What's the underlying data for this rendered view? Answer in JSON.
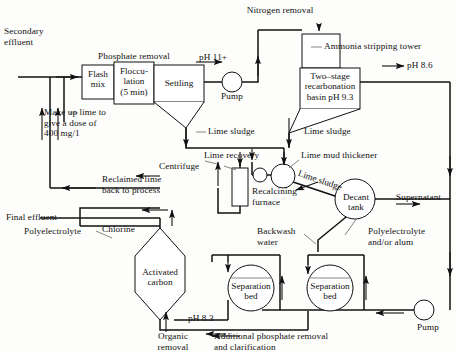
{
  "figure": {
    "type": "process-flow-diagram",
    "stroke_color": "#111111",
    "background_color": "#fdfdfb"
  },
  "section_titles": {
    "phosphate_removal": "Phosphate removal",
    "nitrogen_removal": "Nitrogen removal"
  },
  "units": [
    {
      "id": "flash-mix",
      "label": "Flash\nmix",
      "shape": "rect"
    },
    {
      "id": "flocculation",
      "label": "Floccu-\nlation\n(5 min)",
      "shape": "rect"
    },
    {
      "id": "settling",
      "label": "Settling",
      "shape": "rect-with-hopper"
    },
    {
      "id": "ammonia-stripping-tower",
      "label": "",
      "shape": "tall-rect"
    },
    {
      "id": "recarbonation-basin",
      "label": "Two–stage\nrecarbonation\nbasin pH 9.3",
      "shape": "rect-with-hopper"
    },
    {
      "id": "lime-mud-thickener",
      "label": "",
      "shape": "circle"
    },
    {
      "id": "centrifuge",
      "label": "",
      "shape": "tall-rect"
    },
    {
      "id": "recalcining-furnace",
      "label": "Recalcining\nfurnace",
      "shape": "label-only"
    },
    {
      "id": "decant-tank",
      "label": "Decant\ntank",
      "shape": "circle"
    },
    {
      "id": "activated-carbon",
      "label": "Activated\ncarbon",
      "shape": "hexagon"
    },
    {
      "id": "separation-bed-1",
      "label": "Separation\nbed",
      "shape": "circle"
    },
    {
      "id": "separation-bed-2",
      "label": "Separation\nbed",
      "shape": "circle"
    }
  ],
  "equipment_labels": {
    "ammonia_stripping_tower": "Ammonia stripping tower",
    "lime_mud_thickener": "Lime mud thickener",
    "centrifuge": "Centrifuge",
    "recalcining_furnace": "Recalcining\nfurnace",
    "decant_tank": "Decant\ntank",
    "activated_carbon": "Activated\ncarbon",
    "separation_bed": "Separation\nbed",
    "pump": "Pump"
  },
  "stream_labels": {
    "secondary_effluent": "Secondary\neffluent",
    "make_up_lime": "Make up lime to\ngive a dose of\n400 mg/1",
    "lime_sludge_settling": "Lime sludge",
    "lime_sludge_recarb": "Lime sludge",
    "lime_sludge_thickener": "Lime sludge",
    "lime_recovery": "Lime recovery",
    "reclaimed_lime": "Reclaimed lime\nback to process",
    "final_effluent": "Final effluent",
    "chlorine": "Chlorine",
    "polyelectrolyte_left": "Polyelectrolyte",
    "backwash_water": "Backwash\nwater",
    "supernatant": "Supernatant",
    "polyelectrolyte_alum": "Polyelectrolyte\nand/or alum",
    "organic_removal": "Organic\nremoval",
    "additional_phosphate": "Additional phosphate removal\nand clarification"
  },
  "ph_labels": {
    "after_settling": "pH 11+",
    "after_recarbonation": "pH 8.6",
    "after_carbon": "pH 8.3"
  },
  "pumps": [
    {
      "id": "pump-lime-treated-effluent",
      "label": "Pump"
    },
    {
      "id": "pump-recycle-return",
      "label": "Pump"
    }
  ],
  "colors": {
    "line": "#111111",
    "text": "#111111",
    "unit_fill": "#ffffff",
    "page": "#fdfdfb"
  }
}
